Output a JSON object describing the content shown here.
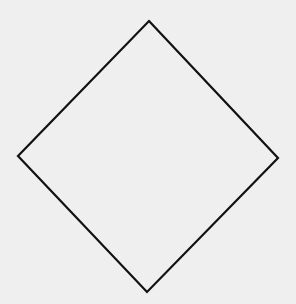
{
  "diagram": {
    "background_color": "#efefef",
    "shapes": [
      {
        "type": "diamond",
        "stroke_color": "#111111",
        "fill": "none",
        "stroke_width": 2.2,
        "vertices": {
          "top": [
            149,
            21
          ],
          "right": [
            278,
            158
          ],
          "bottom": [
            147,
            292
          ],
          "left": [
            18,
            156
          ]
        },
        "points": "149,21 278,158 147,292 18,156"
      }
    ]
  }
}
